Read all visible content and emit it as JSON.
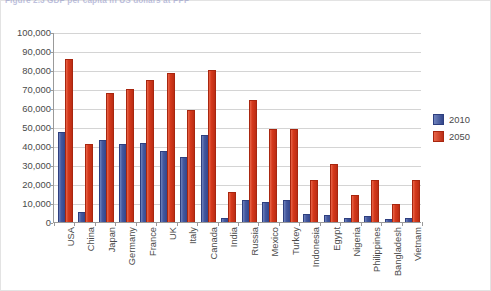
{
  "caption": "Figure 2.3   GDP per capita in US dollars at PPP",
  "chart_data": {
    "type": "bar",
    "title": "GDP per capita in US dollars at PPP",
    "xlabel": "",
    "ylabel": "",
    "ylim": [
      0,
      100000
    ],
    "yticks": [
      "0",
      "10,000",
      "20,000",
      "30,000",
      "40,000",
      "50,000",
      "60,000",
      "70,000",
      "80,000",
      "90,000",
      "100,000"
    ],
    "grid": true,
    "legend_position": "right",
    "categories": [
      "USA",
      "China",
      "Japan",
      "Germany",
      "France",
      "UK",
      "Italy",
      "Canada",
      "India",
      "Russia",
      "Mexico",
      "Turkey",
      "Indonesia",
      "Egypt",
      "Nigeria",
      "Philippines",
      "Bangladesh",
      "Vietnam"
    ],
    "series": [
      {
        "name": "2010",
        "color": "#3b4e96",
        "values": [
          47000,
          5000,
          42500,
          40500,
          41000,
          37000,
          33500,
          45500,
          1500,
          11000,
          10000,
          11000,
          3500,
          3000,
          1500,
          2500,
          1000,
          1500
        ]
      },
      {
        "name": "2050",
        "color": "#d6391c",
        "values": [
          85500,
          40500,
          67500,
          69500,
          74000,
          78000,
          58500,
          79500,
          15500,
          63500,
          48500,
          48500,
          21500,
          30000,
          13500,
          21500,
          9000,
          21500
        ]
      }
    ]
  }
}
